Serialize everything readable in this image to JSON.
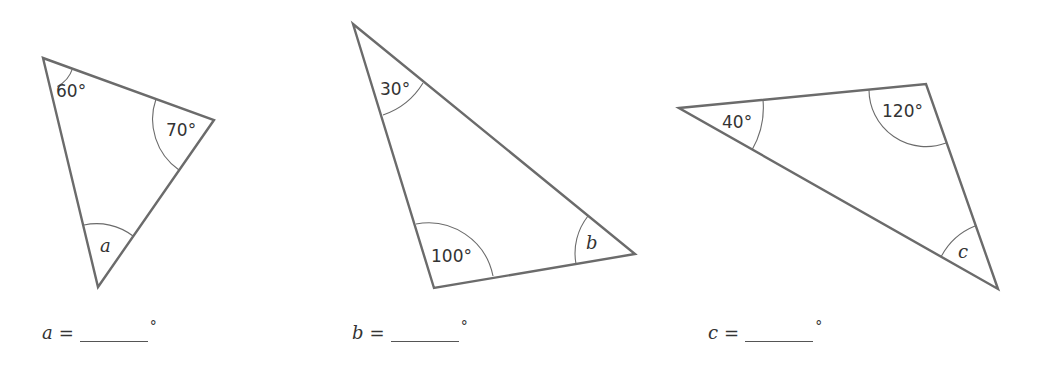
{
  "colors": {
    "line": "#6b6b6b",
    "text": "#333333",
    "background": "#ffffff"
  },
  "triangles": [
    {
      "id": "triangle-a",
      "vertices": [
        [
          43,
          58
        ],
        [
          214,
          120
        ],
        [
          98,
          287
        ]
      ],
      "angles": [
        {
          "vertex": 0,
          "label": "60°",
          "known": true
        },
        {
          "vertex": 1,
          "label": "70°",
          "known": true
        },
        {
          "vertex": 2,
          "label": "a",
          "known": false
        }
      ]
    },
    {
      "id": "triangle-b",
      "vertices": [
        [
          353,
          24
        ],
        [
          635,
          254
        ],
        [
          434,
          288
        ]
      ],
      "angles": [
        {
          "vertex": 0,
          "label": "30°",
          "known": true
        },
        {
          "vertex": 2,
          "label": "100°",
          "known": true
        },
        {
          "vertex": 1,
          "label": "b",
          "known": false
        }
      ]
    },
    {
      "id": "triangle-c",
      "vertices": [
        [
          679,
          108
        ],
        [
          926,
          84
        ],
        [
          998,
          289
        ]
      ],
      "angles": [
        {
          "vertex": 0,
          "label": "40°",
          "known": true
        },
        {
          "vertex": 1,
          "label": "120°",
          "known": true
        },
        {
          "vertex": 2,
          "label": "c",
          "known": false
        }
      ]
    }
  ],
  "answers": [
    {
      "variable": "a",
      "equals": "=",
      "value": "",
      "unit": "°"
    },
    {
      "variable": "b",
      "equals": "=",
      "value": "",
      "unit": "°"
    },
    {
      "variable": "c",
      "equals": "=",
      "value": "",
      "unit": "°"
    }
  ]
}
